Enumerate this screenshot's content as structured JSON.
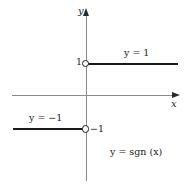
{
  "figure": {
    "background_color": "#ffffff",
    "axis_color": "#8a8a8a",
    "curve_color": "#1a1a1a",
    "text_color": "#1a1a1a"
  },
  "axes": {
    "y_axis_label": "y",
    "x_axis_label": "x",
    "y_tick_label_positive": "1",
    "y_tick_label_negative": "−1"
  },
  "annotations": {
    "upper_branch_label": "y = 1",
    "lower_branch_label": "y = −1",
    "function_label": "y = sgn (x)"
  },
  "chart_data": {
    "type": "line",
    "title": "y = sgn (x)",
    "xlabel": "x",
    "ylabel": "y",
    "xlim": [
      -2.1,
      2.55
    ],
    "ylim": [
      -2.4,
      2.4
    ],
    "grid": false,
    "legend": "none",
    "yticks": [
      1,
      -1
    ],
    "ytick_labels": [
      "1",
      "−1"
    ],
    "xticks": [],
    "series": [
      {
        "name": "y = 1",
        "x": [
          0,
          2.55
        ],
        "y": [
          1,
          1
        ],
        "open_endpoint_at_x": 0,
        "annotation": "y = 1"
      },
      {
        "name": "y = −1",
        "x": [
          -2.05,
          0
        ],
        "y": [
          -1,
          -1
        ],
        "open_endpoint_at_x": 0,
        "annotation": "y = −1"
      }
    ],
    "annotations": [
      "y = 1",
      "y = −1",
      "y = sgn (x)"
    ]
  }
}
